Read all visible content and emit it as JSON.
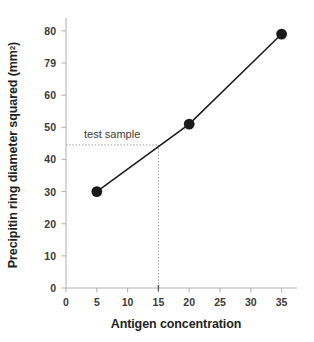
{
  "chart_data": {
    "type": "scatter",
    "title": "",
    "xlabel": "Antigen concentration",
    "ylabel_text": "Precipitin ring diameter squared (mm",
    "ylabel_sup": "2",
    "ylabel_tail": ")",
    "xlim": [
      0,
      37.5
    ],
    "ylim": [
      0,
      84
    ],
    "grid": false,
    "legend": "none",
    "xticks": [
      "0",
      "5",
      "10",
      "15",
      "20",
      "25",
      "30",
      "35"
    ],
    "xtick_values": [
      0,
      5,
      10,
      15,
      20,
      25,
      30,
      35
    ],
    "yticks": [
      "0",
      "10",
      "20",
      "30",
      "40",
      "50",
      "60",
      "79",
      "80"
    ],
    "ytick_values": [
      0,
      10,
      20,
      30,
      40,
      50,
      60,
      70,
      80
    ],
    "series": [
      {
        "name": "standard curve",
        "x": [
          5,
          20,
          35
        ],
        "values": [
          30,
          51,
          79
        ],
        "marker": "filled-circle",
        "color": "#1a1a1a"
      }
    ],
    "annotations": [
      {
        "label": "test sample",
        "x": 15,
        "y": 44.5,
        "guide_style": "dotted"
      }
    ],
    "colors": {
      "data_line": "#1a1a1a",
      "marker": "#1a1a1a",
      "axis": "#b5b5b5",
      "tick_text": "#3a3a3a",
      "guide": "#9a9a9a",
      "background": "#ffffff"
    }
  }
}
